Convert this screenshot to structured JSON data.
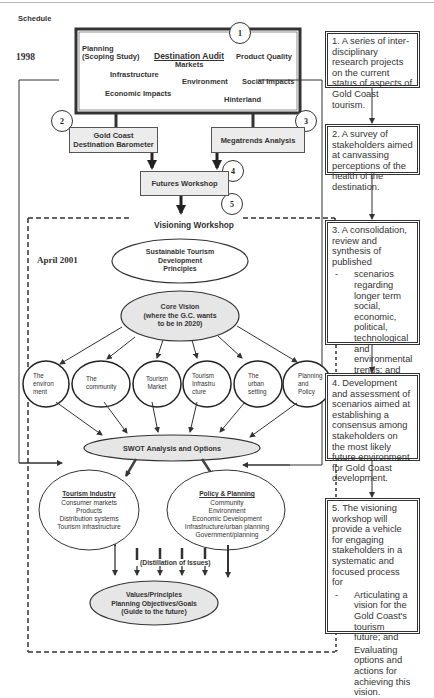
{
  "header": {
    "schedule_label": "Schedule",
    "year_1998": "1998",
    "date_april_2001": "April 2001"
  },
  "audit_box": {
    "title": "Destination Audit",
    "planning_line1": "Planning",
    "planning_line2": "(Scoping Study)",
    "markets": "Markets",
    "product_quality": "Product Quality",
    "infrastructure": "Infrastructure",
    "environment": "Environment",
    "social_impacts": "Social Impacts",
    "economic_impacts": "Economic Impacts",
    "hinterland": "Hinterland",
    "step": "1"
  },
  "barometer": {
    "line1": "Gold Coast",
    "line2": "Destination Barometer",
    "step": "2"
  },
  "megatrends": {
    "label": "Megatrends Analysis",
    "step": "3"
  },
  "futures": {
    "label": "Futures Workshop",
    "step": "4"
  },
  "visioning": {
    "label": "Visioning Workshop",
    "step": "5"
  },
  "principles": {
    "line1": "Sustainable Tourism",
    "line2": "Development",
    "line3": "Principles"
  },
  "core_vision": {
    "line1": "Core Vision",
    "line2": "(where the G.C. wants",
    "line3": "to be in 2020)"
  },
  "themes": [
    {
      "line1": "The",
      "line2": "environ",
      "line3": "ment"
    },
    {
      "line1": "The",
      "line2": "community",
      "line3": ""
    },
    {
      "line1": "Tourism",
      "line2": "Market",
      "line3": ""
    },
    {
      "line1": "Tourism",
      "line2": "Infrastru",
      "line3": "cture"
    },
    {
      "line1": "The",
      "line2": "urban",
      "line3": "setting"
    },
    {
      "line1": "Planning",
      "line2": "and",
      "line3": "Policy"
    }
  ],
  "swot": {
    "label": "SWOT Analysis and Options"
  },
  "tourism_industry": {
    "title": "Tourism Industry",
    "items": [
      "Consumer markets",
      "Products",
      "Distribution systems",
      "Tourism infrastructure"
    ]
  },
  "policy_planning": {
    "title": "Policy & Planning",
    "items": [
      "Community",
      "Environment",
      "Economic Development",
      "Infrastructure/urban planning",
      "Government/planning"
    ]
  },
  "distillation": {
    "label": "(Distillation of Issues)"
  },
  "values": {
    "line1": "Values/Principles",
    "line2": "Planning Objectives/Goals",
    "line3": "(Guide to the future)"
  },
  "notes": [
    {
      "text": "1. A series of inter-disciplinary research projects on the current status of aspects of Gold Coast tourism."
    },
    {
      "text": "2. A survey of stakeholders aimed at canvassing perceptions of the health of the destination."
    },
    {
      "text": "3. A consolidation, review and synthesis of published",
      "bullets": [
        "scenarios regarding longer term social, economic, political, technological and environmental trends; and",
        "tourism demand/supply implications."
      ]
    },
    {
      "text": "4. Development and assessment of scenarios aimed at establishing a consensus among stakeholders on the most likely future environment for Gold Coast development."
    },
    {
      "text": "5. The visioning workshop will provide a vehicle for engaging stakeholders in a systematic and focused process for",
      "bullets": [
        "Articulating a vision for the Gold Coast's tourism future; and",
        "Evaluating options and actions for achieving this vision."
      ]
    }
  ],
  "colors": {
    "line": "#333333",
    "fill_grey": "#ececec",
    "fill_ellipse": "#e6e6e6"
  }
}
